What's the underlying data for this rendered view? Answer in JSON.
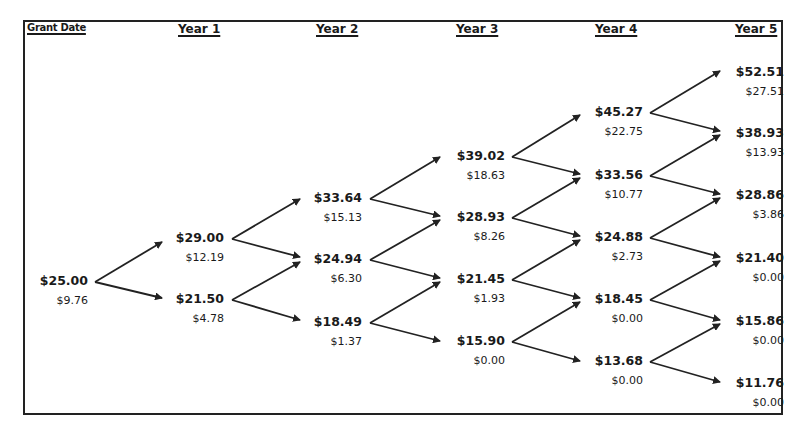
{
  "headers": [
    "Grant Date",
    "Year 1",
    "Year 2",
    "Year 3",
    "Year 4",
    "Year 5"
  ],
  "colors": {
    "line": "#222222",
    "text": "#1a1a1a",
    "background": "#ffffff"
  },
  "tree": {
    "grant": [
      {
        "price": "$25.00",
        "value": "$9.76"
      }
    ],
    "year1": [
      {
        "price": "$29.00",
        "value": "$12.19"
      },
      {
        "price": "$21.50",
        "value": "$4.78"
      }
    ],
    "year2": [
      {
        "price": "$33.64",
        "value": "$15.13"
      },
      {
        "price": "$24.94",
        "value": "$6.30"
      },
      {
        "price": "$18.49",
        "value": "$1.37"
      }
    ],
    "year3": [
      {
        "price": "$39.02",
        "value": "$18.63"
      },
      {
        "price": "$28.93",
        "value": "$8.26"
      },
      {
        "price": "$21.45",
        "value": "$1.93"
      },
      {
        "price": "$15.90",
        "value": "$0.00"
      }
    ],
    "year4": [
      {
        "price": "$45.27",
        "value": "$22.75"
      },
      {
        "price": "$33.56",
        "value": "$10.77"
      },
      {
        "price": "$24.88",
        "value": "$2.73"
      },
      {
        "price": "$18.45",
        "value": "$0.00"
      },
      {
        "price": "$13.68",
        "value": "$0.00"
      }
    ],
    "year5": [
      {
        "price": "$52.51",
        "value": "$27.51"
      },
      {
        "price": "$38.93",
        "value": "$13.93"
      },
      {
        "price": "$28.86",
        "value": "$3.86"
      },
      {
        "price": "$21.40",
        "value": "$0.00"
      },
      {
        "price": "$15.86",
        "value": "$0.00"
      },
      {
        "price": "$11.76",
        "value": "$0.00"
      }
    ]
  }
}
